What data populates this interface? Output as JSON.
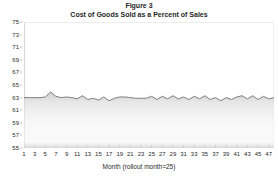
{
  "chart_data": {
    "type": "line",
    "title": "Figure 3",
    "subtitle": "Cost of Goods Sold as a Percent of Sales",
    "xlabel": "Month (rollout month=25)",
    "ylabel": "",
    "ylim": [
      55,
      75
    ],
    "xlim": [
      1,
      48
    ],
    "grid": false,
    "legend": null,
    "y_ticks": [
      75,
      73,
      71,
      69,
      67,
      65,
      63,
      61,
      59,
      57,
      55
    ],
    "x_ticks": [
      1,
      3,
      5,
      7,
      9,
      11,
      13,
      15,
      17,
      19,
      21,
      23,
      25,
      27,
      29,
      31,
      33,
      35,
      37,
      39,
      41,
      43,
      45,
      47
    ],
    "series": [
      {
        "name": "Cost of Goods Sold as a Percent of Sales",
        "color": "#808080",
        "x": [
          1,
          2,
          3,
          4,
          5,
          6,
          7,
          8,
          9,
          10,
          11,
          12,
          13,
          14,
          15,
          16,
          17,
          18,
          19,
          20,
          21,
          22,
          23,
          24,
          25,
          26,
          27,
          28,
          29,
          30,
          31,
          32,
          33,
          34,
          35,
          36,
          37,
          38,
          39,
          40,
          41,
          42,
          43,
          44,
          45,
          46,
          47,
          48
        ],
        "values": [
          63.0,
          63.0,
          63.0,
          63.0,
          63.1,
          63.9,
          63.2,
          63.0,
          63.1,
          63.0,
          62.8,
          63.3,
          62.7,
          62.9,
          62.6,
          63.1,
          62.5,
          62.9,
          63.1,
          63.1,
          63.0,
          62.9,
          62.9,
          62.9,
          63.2,
          62.7,
          63.2,
          62.8,
          63.3,
          62.8,
          63.1,
          62.7,
          63.2,
          62.8,
          63.3,
          62.7,
          63.0,
          62.5,
          63.0,
          62.7,
          63.1,
          63.3,
          62.8,
          63.3,
          62.7,
          63.2,
          62.8,
          63.0
        ]
      }
    ]
  },
  "axis": {
    "y_title": "",
    "x_title": "Month (rollout month=25)"
  },
  "colors": {
    "line": "#808080",
    "frame": "#d9d9d9",
    "shade_top": "#d4d4d4",
    "shade_bottom": "#ffffff",
    "text": "#262626"
  }
}
